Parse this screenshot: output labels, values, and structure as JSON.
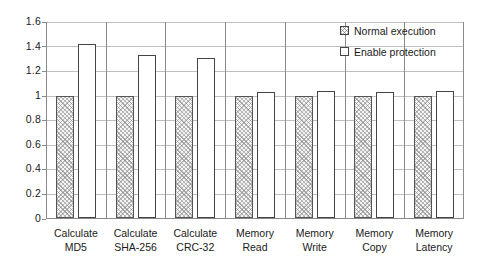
{
  "chart_data": {
    "type": "bar",
    "title": "",
    "subtitle": "",
    "xlabel": "",
    "ylabel": "",
    "ylim": [
      0,
      1.6
    ],
    "ytick_labels": [
      "1.6",
      "1.4",
      "1.2",
      "1",
      "0.8",
      "0.6",
      "0.4",
      "0.2",
      "0"
    ],
    "ytick_values": [
      1.6,
      1.4,
      1.2,
      1.0,
      0.8,
      0.6,
      0.4,
      0.2,
      0
    ],
    "grid": true,
    "legend_position": "top-right",
    "categories": [
      "Calculate MD5",
      "Calculate SHA-256",
      "Calculate CRC-32",
      "Memory Read",
      "Memory Write",
      "Memory Copy",
      "Memory Latency"
    ],
    "category_lines": [
      [
        "Calculate",
        "MD5"
      ],
      [
        "Calculate",
        "SHA-256"
      ],
      [
        "Calculate",
        "CRC-32"
      ],
      [
        "Memory",
        "Read"
      ],
      [
        "Memory",
        "Write"
      ],
      [
        "Memory",
        "Copy"
      ],
      [
        "Memory",
        "Latency"
      ]
    ],
    "series": [
      {
        "name": "Normal execution",
        "fill": "hatched",
        "values": [
          1.0,
          1.0,
          1.0,
          1.0,
          1.0,
          1.0,
          1.0
        ]
      },
      {
        "name": "Enable protection",
        "fill": "white",
        "values": [
          1.42,
          1.33,
          1.31,
          1.03,
          1.04,
          1.03,
          1.04
        ]
      }
    ]
  },
  "legend": {
    "items": [
      {
        "label": "Normal execution",
        "swatch": "hatched-square-icon"
      },
      {
        "label": "Enable protection",
        "swatch": "empty-square-icon"
      }
    ]
  },
  "colors": {
    "gridline": "#bfbfbf",
    "axis": "#8a8a8a",
    "bar_outline": "#555555",
    "hatch": "#787878",
    "protect_fill": "#ffffff",
    "text": "#1a1a1a",
    "background": "#ffffff"
  }
}
